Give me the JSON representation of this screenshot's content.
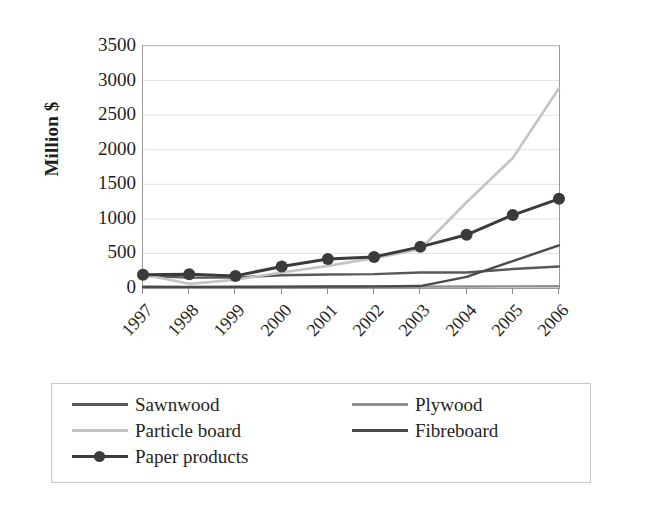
{
  "chart_data": {
    "type": "line",
    "title": "",
    "subtitle": "",
    "xlabel": "",
    "ylabel": "Million $",
    "x": [
      1997,
      1998,
      1999,
      2000,
      2001,
      2002,
      2003,
      2004,
      2005,
      2006
    ],
    "x_tick_labels": [
      "1997",
      "1998",
      "1999",
      "2000",
      "2001",
      "2002",
      "2003",
      "2004",
      "2005",
      "2006"
    ],
    "y_tick_labels": [
      "0",
      "500",
      "1000",
      "1500",
      "2000",
      "2500",
      "3000",
      "3500"
    ],
    "y_ticks": [
      0,
      500,
      1000,
      1500,
      2000,
      2500,
      3000,
      3500
    ],
    "ylim": [
      0,
      3500
    ],
    "grid": "horizontal",
    "legend_position": "bottom",
    "series": [
      {
        "name": "Sawnwood",
        "color": "#595959",
        "marker": "none",
        "width": 2.4,
        "values": [
          175,
          150,
          150,
          185,
          195,
          200,
          225,
          225,
          275,
          310
        ]
      },
      {
        "name": "Plywood",
        "color": "#8f8f8f",
        "marker": "none",
        "width": 2.4,
        "values": [
          10,
          10,
          12,
          14,
          16,
          18,
          20,
          22,
          24,
          25
        ]
      },
      {
        "name": "Particle board",
        "color": "#c4c4c4",
        "marker": "none",
        "width": 2.6,
        "values": [
          195,
          60,
          120,
          225,
          320,
          430,
          560,
          1240,
          1880,
          2890
        ]
      },
      {
        "name": "Fibreboard",
        "color": "#4a4a4a",
        "marker": "none",
        "width": 2.4,
        "values": [
          18,
          16,
          18,
          20,
          22,
          24,
          28,
          160,
          390,
          615
        ]
      },
      {
        "name": "Paper products",
        "color": "#3b3b3b",
        "marker": "circle",
        "width": 3.0,
        "values": [
          190,
          200,
          175,
          310,
          420,
          450,
          595,
          770,
          1055,
          1290
        ]
      }
    ]
  },
  "legend": {
    "items": [
      {
        "label": "Sawnwood",
        "color": "#595959",
        "marker": "none",
        "col": 0,
        "row": 0
      },
      {
        "label": "Plywood",
        "color": "#8f8f8f",
        "marker": "none",
        "col": 1,
        "row": 0
      },
      {
        "label": "Particle board",
        "color": "#c4c4c4",
        "marker": "none",
        "col": 0,
        "row": 1
      },
      {
        "label": "Fibreboard",
        "color": "#4a4a4a",
        "marker": "none",
        "col": 1,
        "row": 1
      },
      {
        "label": "Paper products",
        "color": "#3b3b3b",
        "marker": "circle",
        "col": 0,
        "row": 2
      }
    ]
  },
  "axes": {
    "y_title": "Million $",
    "gridline_color": "#e2e2e2",
    "frame_color": "#9a9a9a"
  }
}
